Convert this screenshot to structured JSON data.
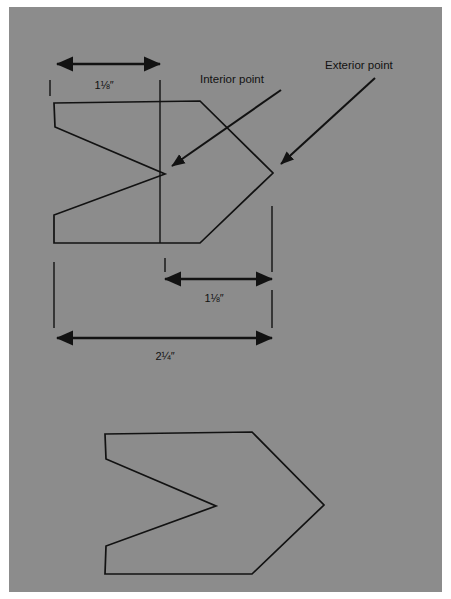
{
  "figure": {
    "background_color": "#8c8c8c",
    "plate_color": "#ffffff",
    "line_color": "#121212",
    "plate": {
      "x": 9,
      "y": 7,
      "width": 433,
      "height": 585
    },
    "annotations": [
      {
        "name": "interior-point",
        "label": "Interior point",
        "text_x": 200,
        "text_y": 80,
        "leader": {
          "x1": 281,
          "y1": 90,
          "x2": 172,
          "y2": 166
        },
        "arrow_angle_deg": 145
      },
      {
        "name": "exterior-point",
        "label": "Exterior point",
        "text_x": 325,
        "text_y": 66,
        "leader": {
          "x1": 375,
          "y1": 78,
          "x2": 281,
          "y2": 164
        },
        "arrow_angle_deg": 138
      }
    ],
    "dimensions": [
      {
        "name": "top-width-dimension",
        "label": "1⅛″",
        "x1": 57,
        "x2": 160,
        "y": 64,
        "text_x": 104,
        "text_y": 86,
        "ticks": [
          {
            "x": 50,
            "y1": 80,
            "y2": 96
          },
          {
            "x": 160,
            "y1": 80,
            "y2": 243
          }
        ]
      },
      {
        "name": "middle-width-dimension",
        "label": "1⅛″",
        "x1": 165,
        "x2": 272,
        "y": 279,
        "text_x": 214,
        "text_y": 299,
        "ticks": [
          {
            "x": 165,
            "y1": 258,
            "y2": 272
          },
          {
            "x": 272,
            "y1": 206,
            "y2": 272
          }
        ]
      },
      {
        "name": "overall-width-dimension",
        "label": "2¼″",
        "x1": 57,
        "x2": 272,
        "y": 338,
        "text_x": 165,
        "text_y": 357,
        "ticks": [
          {
            "x": 54,
            "y1": 262,
            "y2": 328
          },
          {
            "x": 272,
            "y1": 290,
            "y2": 328
          }
        ]
      }
    ],
    "shapes": [
      {
        "name": "upper-chevron-shape",
        "points": "54,103 200,101 273,173 200,243 54,243 54,215 165,174 55,127"
      },
      {
        "name": "lower-chevron-shape",
        "points": "105,434 252,432 324,505 252,574 105,574 106,546 216,506 106,459"
      }
    ]
  }
}
